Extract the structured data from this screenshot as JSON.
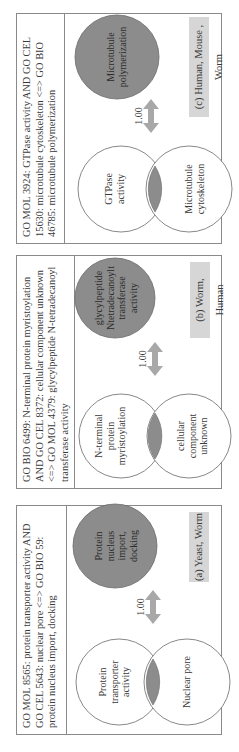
{
  "figure": {
    "rotation": "-90deg",
    "colors": {
      "border": "#8a8a8a",
      "filled_circle": "#8c8c8c",
      "overlap_fill": "#8c8c8c",
      "arrow": "#a8a8a8",
      "label_background": "#d6d6d6"
    },
    "panels": [
      {
        "id": "a",
        "caption": "GO MOL 8565: protein transporter activity AND GO CEL 5643: nuclear pore <=> GO BIO 59: protein nucleus import, docking",
        "venn_left": "Protein transporter activity",
        "venn_right": "Nuclear pore",
        "target": "Protein nucleus import, docking",
        "score": "1.00",
        "label": "(a) Yeast, Worm"
      },
      {
        "id": "b",
        "caption": "GO BIO 6499: N-terminal protein myristoylation AND GO CEL 8372: cellular component unknown <=> GO MOL 4379: glycylpeptide N-tetradecanoyl transferase activity",
        "venn_left": "N-terminal protein myristoylation",
        "venn_right": "cellular component unknown",
        "target": "glycylpeptide Ntetradecanoylt transferase activity",
        "score": "1.00",
        "label": "(b) Worm, Human"
      },
      {
        "id": "c",
        "caption": "GO MOL 3924: GTPase activity AND GO CEL 15630: microtubule cytoskeleton <=> GO BIO 46785: microtubule polymerization",
        "venn_left": "GTPase activity",
        "venn_right": "Microtubule cytoskeleton",
        "target": "Microtubule polymerization",
        "score": "1.00",
        "label": "(c) Human, Mouse , Worm"
      }
    ]
  }
}
